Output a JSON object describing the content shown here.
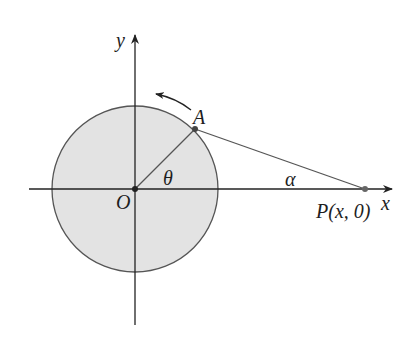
{
  "diagram": {
    "title": "",
    "colors": {
      "background": "#ffffff",
      "circle_fill": "#e3e3e3",
      "circle_stroke": "#555555",
      "axis": "#222222",
      "segment": "#555555",
      "point": "#444444",
      "text": "#1e1e1e"
    },
    "axes": {
      "x_label": "x",
      "y_label": "y"
    },
    "points": {
      "origin": {
        "label": "O"
      },
      "a": {
        "label": "A"
      },
      "p": {
        "label_main": "P",
        "label_coords": "(x, 0)"
      }
    },
    "angles": {
      "theta": "θ",
      "alpha": "α"
    },
    "rotation_arrow": {
      "direction": "counterclockwise"
    }
  }
}
